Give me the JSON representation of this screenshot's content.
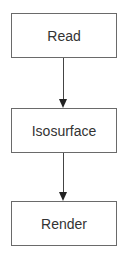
{
  "diagram": {
    "type": "flowchart",
    "direction": "top-to-bottom",
    "nodes": [
      {
        "id": "read",
        "label": "Read"
      },
      {
        "id": "isosurface",
        "label": "Isosurface"
      },
      {
        "id": "render",
        "label": "Render"
      }
    ],
    "edges": [
      {
        "from": "read",
        "to": "isosurface"
      },
      {
        "from": "isosurface",
        "to": "render"
      }
    ]
  }
}
